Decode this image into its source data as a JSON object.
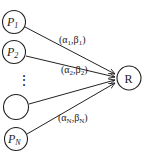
{
  "diagram": {
    "type": "fan-in graph",
    "source_nodes": [
      {
        "id": "P1",
        "base": "P",
        "sub": "1",
        "edge_label": {
          "alpha": "α",
          "alpha_sub": "1",
          "beta": "β",
          "beta_sub": "1"
        }
      },
      {
        "id": "P2",
        "base": "P",
        "sub": "2",
        "edge_label": {
          "alpha": "α",
          "alpha_sub": "2",
          "beta": "β",
          "beta_sub": "2"
        }
      },
      {
        "id": "blank",
        "base": "",
        "sub": ""
      },
      {
        "id": "PN",
        "base": "P",
        "sub": "N",
        "edge_label": {
          "alpha": "α",
          "alpha_sub": "N",
          "beta": "β",
          "beta_sub": "N"
        }
      }
    ],
    "ellipsis": "⋮",
    "target_node": {
      "id": "R",
      "label": "R"
    },
    "colors": {
      "stroke": "#222222",
      "background": "#ffffff"
    }
  }
}
